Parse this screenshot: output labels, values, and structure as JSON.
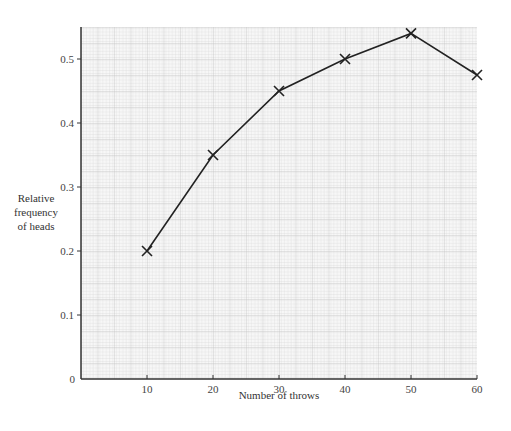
{
  "chart_data": {
    "type": "line",
    "title": "",
    "xlabel": "Number of throws",
    "ylabel": [
      "Relative",
      "frequency",
      "of heads"
    ],
    "x": [
      10,
      20,
      30,
      40,
      50,
      60
    ],
    "series": [
      {
        "name": "Relative frequency of heads",
        "values": [
          0.2,
          0.35,
          0.45,
          0.5,
          0.54,
          0.475
        ],
        "marker": "x",
        "color": "#222222"
      }
    ],
    "x_ticks": [
      10,
      20,
      30,
      40,
      50,
      60
    ],
    "x_tick_labels": [
      "10",
      "20",
      "30",
      "40",
      "50",
      "60"
    ],
    "y_ticks": [
      0,
      0.1,
      0.2,
      0.3,
      0.4,
      0.5
    ],
    "y_tick_labels": [
      "0",
      "0.1",
      "0.2",
      "0.3",
      "0.4",
      "0.5"
    ],
    "xlim": [
      0,
      60
    ],
    "ylim": [
      0,
      0.55
    ],
    "grid": true,
    "grid_style": "fine graph-paper",
    "legend": "none"
  }
}
